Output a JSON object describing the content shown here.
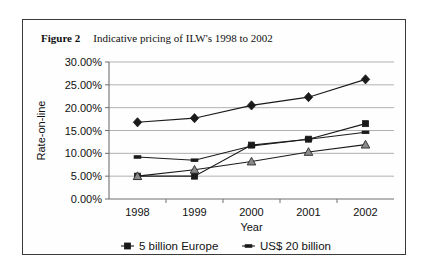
{
  "caption": {
    "label": "Figure 2",
    "text": "Indicative pricing of ILW's 1998 to 2002"
  },
  "chart_data": {
    "type": "line",
    "title": "Indicative pricing of ILW's 1998 to 2002",
    "xlabel": "Year",
    "ylabel": "Rate-on-line",
    "categories": [
      "1998",
      "1999",
      "2000",
      "2001",
      "2002"
    ],
    "ylim": [
      0,
      30
    ],
    "ytick_labels": [
      "0.00%",
      "5.00%",
      "10.00%",
      "15.00%",
      "20.00%",
      "25.00%",
      "30.00%"
    ],
    "ytick_values": [
      0,
      5,
      10,
      15,
      20,
      25,
      30
    ],
    "grid": true,
    "legend_position": "bottom",
    "series": [
      {
        "name": "5 billion Europe",
        "marker": "square",
        "values": [
          5.0,
          5.0,
          11.8,
          13.1,
          16.5
        ]
      },
      {
        "name": "US$ 20 billion",
        "marker": "dash",
        "values": [
          9.2,
          8.5,
          11.6,
          13.1,
          14.6
        ]
      },
      {
        "name": "US$ 10 billion",
        "marker": "diamond",
        "values": [
          16.8,
          17.7,
          20.5,
          22.3,
          26.2
        ]
      },
      {
        "name": "US$ 25 billion",
        "marker": "triangle",
        "values": [
          5.0,
          6.4,
          8.2,
          10.3,
          11.9
        ]
      }
    ]
  }
}
